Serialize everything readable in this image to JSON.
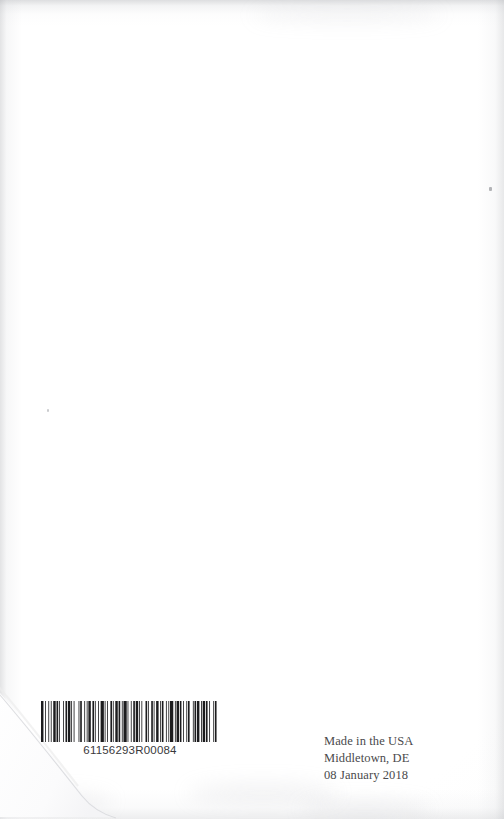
{
  "page": {
    "kind": "book-back-cover-scan",
    "width": 504,
    "height": 819,
    "background_color": "#ffffff",
    "paper_tint": "#fdfdfd",
    "edge_shadow_color": "#aaacb0"
  },
  "barcode": {
    "symbology": "Code 128",
    "human_readable_number": "61156293R00084",
    "ink_color": "#1c1c1e",
    "bar_pattern": [
      3,
      2,
      1,
      3,
      1,
      2,
      1,
      2,
      3,
      1,
      2,
      1,
      1,
      4,
      1,
      2,
      2,
      1,
      3,
      1,
      1,
      2,
      1,
      5,
      1,
      1,
      2,
      3,
      1,
      2,
      1,
      1,
      3,
      2,
      2,
      1,
      1,
      3,
      1,
      2,
      4,
      1,
      1,
      2,
      1,
      3,
      2,
      1,
      1,
      2,
      3,
      1,
      2,
      2,
      1,
      1,
      4,
      1,
      1,
      3,
      1,
      2,
      2,
      1,
      3,
      1,
      1,
      2,
      1,
      4,
      2,
      1,
      1,
      3,
      2,
      1,
      1,
      2,
      3,
      2,
      1,
      1,
      2,
      3,
      1,
      2,
      1,
      1,
      4,
      2,
      1,
      1,
      3,
      1,
      2,
      2,
      1,
      3,
      1,
      1,
      2,
      4,
      1,
      1,
      2,
      1,
      3,
      2,
      1,
      1,
      3,
      1,
      2,
      2,
      1,
      4,
      1,
      1,
      2,
      3
    ]
  },
  "imprint": {
    "lines": [
      "Made in the USA",
      "Middletown, DE",
      "08 January 2018"
    ],
    "line_1": "Made in the USA",
    "line_2": "Middletown, DE",
    "line_3": "08 January 2018",
    "text_color": "#4a4a4c"
  },
  "artifacts": {
    "corner_fold": "bottom-left-curl",
    "specks": 2
  }
}
